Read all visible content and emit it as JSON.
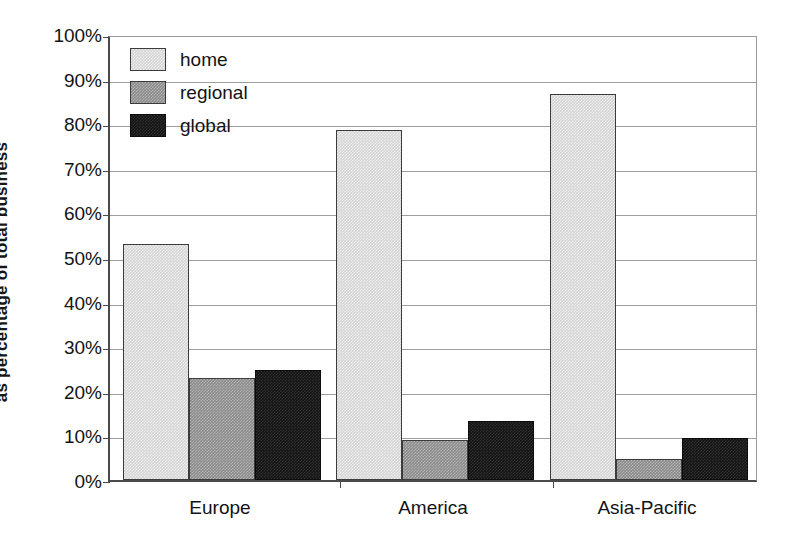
{
  "chart_data": {
    "type": "bar",
    "title": "",
    "xlabel": "",
    "ylabel": "as percentage of total business",
    "categories": [
      "Europe",
      "America",
      "Asia-Pacific"
    ],
    "series": [
      {
        "name": "home",
        "color": "#d5d5d5",
        "values": [
          53.0,
          78.5,
          86.5
        ]
      },
      {
        "name": "regional",
        "color": "#8b8b8b",
        "values": [
          22.8,
          9.0,
          4.7
        ]
      },
      {
        "name": "global",
        "color": "#141414",
        "values": [
          24.7,
          13.3,
          9.5
        ]
      }
    ],
    "ylim": [
      0,
      100
    ],
    "y_ticks": [
      0,
      10,
      20,
      30,
      40,
      50,
      60,
      70,
      80,
      90,
      100
    ],
    "y_tick_labels": [
      "0%",
      "10%",
      "20%",
      "30%",
      "40%",
      "50%",
      "60%",
      "70%",
      "80%",
      "90%",
      "100%"
    ],
    "grid": true,
    "legend_position": "top-left-inside",
    "legend_entries": [
      "home",
      "regional",
      "global"
    ]
  }
}
